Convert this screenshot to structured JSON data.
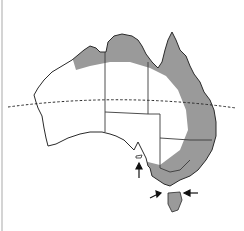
{
  "map": {
    "subject": "Australia",
    "shaded_region": "northern and eastern coastal band incl. Tasmania",
    "reference_line": "Tropic of Capricorn (dashed)",
    "arrows": 3,
    "colors": {
      "background": "#ffffff",
      "outline": "#2a2a2a",
      "shade": "#9a9a9a",
      "border_lines": "#3a3a3a"
    }
  }
}
